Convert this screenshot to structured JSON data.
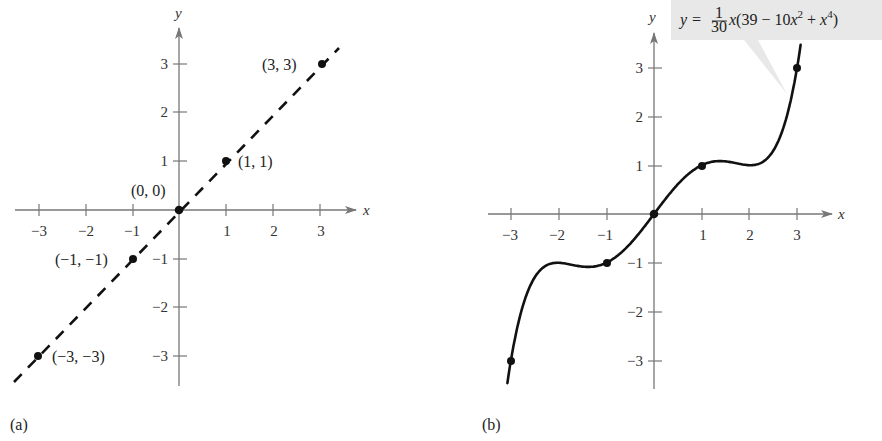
{
  "chart_data": [
    {
      "type": "line",
      "panel_label": "(a)",
      "series": [
        {
          "name": "y = x",
          "style": "dashed",
          "x": [
            -3.5,
            3.4
          ],
          "y": [
            -3.5,
            3.4
          ]
        }
      ],
      "points": [
        {
          "x": -3,
          "y": -3,
          "label": "(−3, −3)"
        },
        {
          "x": -1,
          "y": -1,
          "label": "(−1, −1)"
        },
        {
          "x": 0,
          "y": 0,
          "label": "(0, 0)"
        },
        {
          "x": 1,
          "y": 1,
          "label": "(1, 1)"
        },
        {
          "x": 3,
          "y": 3,
          "label": "(3, 3)"
        }
      ],
      "xlabel": "x",
      "ylabel": "y",
      "xticks": [
        -3,
        -2,
        -1,
        1,
        2,
        3
      ],
      "yticks": [
        -3,
        -2,
        -1,
        1,
        2,
        3
      ],
      "xtick_labels": [
        "−3",
        "−2",
        "−1",
        "1",
        "2",
        "3"
      ],
      "ytick_labels": [
        "−3",
        "−2",
        "−1",
        "1",
        "2",
        "3"
      ],
      "xlim": [
        -3.5,
        3.7
      ],
      "ylim": [
        -3.6,
        3.7
      ],
      "grid": false
    },
    {
      "type": "line",
      "panel_label": "(b)",
      "series": [
        {
          "name": "y = (1/30)x(39 − 10x² + x⁴)",
          "style": "solid",
          "function": "x*(39 - 10*x^2 + x^4)/30",
          "x_range": [
            -3.1,
            3.1
          ]
        }
      ],
      "points": [
        {
          "x": -3,
          "y": -3
        },
        {
          "x": -1,
          "y": -1
        },
        {
          "x": 0,
          "y": 0
        },
        {
          "x": 1,
          "y": 1
        },
        {
          "x": 3,
          "y": 3
        }
      ],
      "annotation": {
        "text": "y = (1/30)x(39 − 10x² + x⁴)",
        "parts": {
          "lhs": "y =",
          "frac_num": "1",
          "frac_den": "30",
          "rhs_var": "x",
          "rhs_open": "(39 − 10",
          "rhs_x2": "x",
          "exp2": "2",
          "rhs_plus": " + ",
          "rhs_x4": "x",
          "exp4": "4",
          "rhs_close": ")"
        }
      },
      "xlabel": "x",
      "ylabel": "y",
      "xticks": [
        -3,
        -2,
        -1,
        1,
        2,
        3
      ],
      "yticks": [
        -3,
        -2,
        -1,
        1,
        2,
        3
      ],
      "xtick_labels": [
        "−3",
        "−2",
        "−1",
        "1",
        "2",
        "3"
      ],
      "ytick_labels": [
        "−3",
        "−2",
        "−1",
        "1",
        "2",
        "3"
      ],
      "xlim": [
        -3.5,
        3.7
      ],
      "ylim": [
        -3.6,
        3.7
      ],
      "grid": false
    }
  ],
  "colors": {
    "axis": "#777777",
    "curve": "#111111",
    "callout_fill": "#e8e8e8"
  }
}
